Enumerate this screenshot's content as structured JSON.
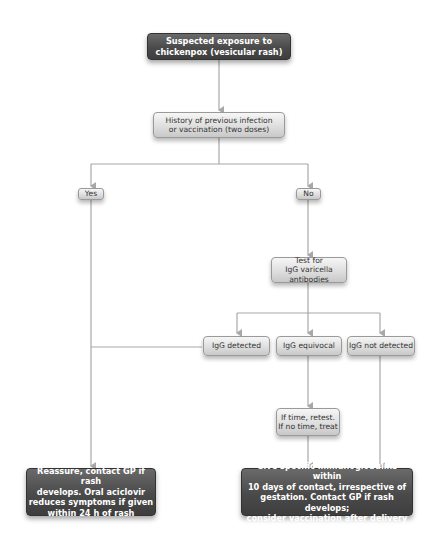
{
  "diagram": {
    "nodes": {
      "start": "Suspected exposure to\nchickenpox (vesicular rash)",
      "history": "History of previous infection\nor vaccination (two doses)",
      "yes": "Yes",
      "no": "No",
      "test": "Test for\nIgG varicella antibodies",
      "igg_detected": "IgG detected",
      "igg_equivocal": "IgG equivocal",
      "igg_not_detected": "IgG not detected",
      "retest": "If time, retest.\nIf  no time, treat",
      "reassure": "Reassure, contact GP if rash\ndevelops. Oral aciclovir\nreduces symptoms if given\nwithin 24 h of rash",
      "immunoglobulins": "Give specific immunoglobulins within\n10 days of contact, irrespective of\ngestation. Contact GP if rash develops;\nconsider vaccination after delivery"
    },
    "colors": {
      "dark_box": "#4a4a4a",
      "light_box": "#dcdcdc",
      "line": "#a8a8a8"
    }
  }
}
